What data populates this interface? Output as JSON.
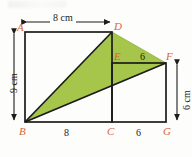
{
  "figure": {
    "kind": "geometry-diagram",
    "colors": {
      "shade": "#a6c64b",
      "shade_edge": "#8fae3c",
      "stroke": "#1c1c1c",
      "label": "#d4663c",
      "background": "#fdfdfb"
    },
    "vertices": [
      {
        "name": "A",
        "x": 25,
        "y": 32
      },
      {
        "name": "D",
        "x": 112,
        "y": 32
      },
      {
        "name": "E",
        "x": 112,
        "y": 63
      },
      {
        "name": "F",
        "x": 166,
        "y": 63
      },
      {
        "name": "B",
        "x": 25,
        "y": 122
      },
      {
        "name": "C",
        "x": 112,
        "y": 122
      },
      {
        "name": "G",
        "x": 166,
        "y": 122
      }
    ],
    "labels": {
      "A": "A",
      "D": "D",
      "E": "E",
      "F": "F",
      "B": "B",
      "C": "C",
      "G": "G"
    },
    "dimensions": {
      "top": "8 cm",
      "left": "9 cm",
      "right": "6 cm",
      "bottom_left": "8",
      "bottom_right": "6",
      "top_right": "6"
    },
    "shaded_polygon": "B,D,F"
  }
}
